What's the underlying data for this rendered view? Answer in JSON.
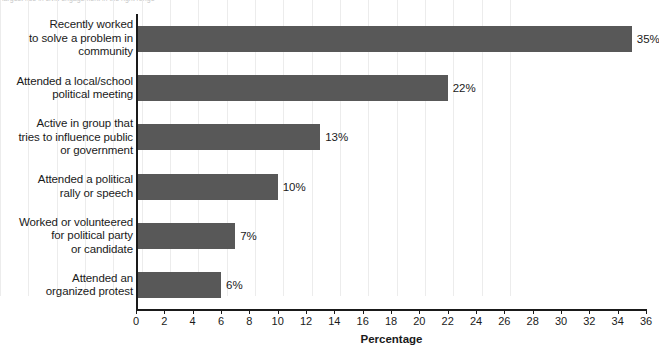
{
  "top_note": {
    "text": "largest rise in civic engagement in the right range"
  },
  "chart_data": {
    "type": "bar",
    "orientation": "horizontal",
    "title": "",
    "subtitle": "",
    "xlabel": "Percentage",
    "ylabel": "",
    "xlim": [
      0,
      36
    ],
    "xticks": [
      0,
      2,
      4,
      6,
      8,
      10,
      12,
      14,
      16,
      18,
      20,
      22,
      24,
      26,
      28,
      30,
      32,
      34,
      36
    ],
    "xtick_labels": [
      "0",
      "2",
      "4",
      "6",
      "8",
      "10",
      "12",
      "14",
      "16",
      "18",
      "20",
      "22",
      "24",
      "26",
      "28",
      "30",
      "32",
      "34",
      "36"
    ],
    "grid": "vertical",
    "legend": "none",
    "bar_color": "#585858",
    "categories": [
      "Recently worked to solve a problem in community",
      "Attended a local/school political meeting",
      "Active in group that tries to influence public or government",
      "Attended a political rally or speech",
      "Worked or volunteered for political party or candidate",
      "Attended an organized protest"
    ],
    "category_lines": [
      [
        "Recently worked",
        "to solve a problem in",
        "community"
      ],
      [
        "Attended a local/school",
        "political meeting"
      ],
      [
        "Active in group that",
        "tries to influence public",
        "or government"
      ],
      [
        "Attended a political",
        "rally or speech"
      ],
      [
        "Worked or volunteered",
        "for political party",
        "or candidate"
      ],
      [
        "Attended an",
        "organized protest"
      ]
    ],
    "values": [
      35,
      22,
      13,
      10,
      7,
      6
    ],
    "value_labels": [
      "35%",
      "22%",
      "13%",
      "10%",
      "7%",
      "6%"
    ]
  }
}
